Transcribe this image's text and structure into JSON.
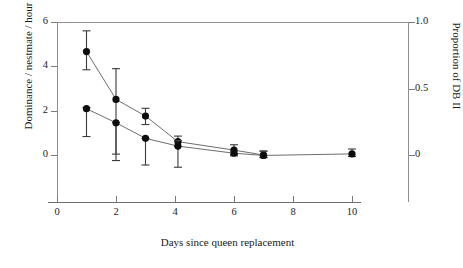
{
  "chart_data": {
    "type": "line",
    "title": "",
    "xlabel": "Days since queen replacement",
    "ylabel": "Dominance / nestmate / hour",
    "y2label": "Proportion of DB II",
    "xlim": [
      0,
      11
    ],
    "ylim": [
      -1.6,
      6
    ],
    "y2lim": [
      -0.27,
      1.0
    ],
    "xticks": [
      "0",
      "2",
      "4",
      "6",
      "8",
      "10"
    ],
    "xtickvalues": [
      0,
      2,
      4,
      6,
      8,
      10
    ],
    "yticks": [
      "0",
      "2",
      "4",
      "6"
    ],
    "ytickvalues": [
      0,
      2,
      4,
      6
    ],
    "y2ticks": [
      "0",
      "0.5",
      "1.0"
    ],
    "y2tickvalues": [
      0,
      0.5,
      1.0
    ],
    "grid": false,
    "legend": "none",
    "marker": "filled-circle",
    "errorbars": true,
    "series": [
      {
        "name": "Dominance / nestmate / hour",
        "axis": "left",
        "x": [
          1,
          2,
          3,
          4.1,
          6,
          7
        ],
        "values": [
          4.65,
          2.5,
          1.75,
          0.6,
          0.22,
          0.0
        ],
        "err_low": [
          0.82,
          2.46,
          0.38,
          0.22,
          0.2,
          0.12
        ],
        "err_high": [
          0.93,
          1.38,
          0.35,
          0.25,
          0.24,
          0.17
        ]
      },
      {
        "name": "Proportion of DB II",
        "axis": "right",
        "x": [
          1,
          2,
          3,
          4.1,
          6,
          7,
          10
        ],
        "values": [
          2.08,
          1.45,
          0.75,
          0.4,
          0.08,
          -0.02,
          0.05
        ],
        "err_low": [
          1.25,
          1.7,
          1.2,
          0.95,
          0.12,
          0.08,
          0.12
        ],
        "err_high": [
          0.05,
          0.0,
          0.0,
          0.25,
          0.12,
          0.2,
          0.22
        ]
      }
    ]
  }
}
